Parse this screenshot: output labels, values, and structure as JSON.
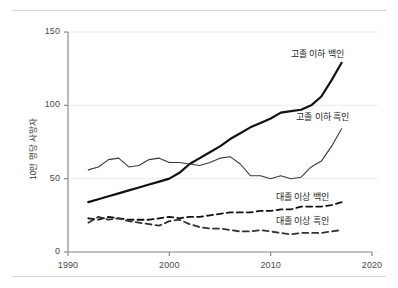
{
  "chart_data": {
    "type": "line",
    "title": "",
    "xlabel": "",
    "ylabel": "10만 명당 사망자",
    "xlim": [
      1990,
      2020
    ],
    "ylim": [
      0,
      150
    ],
    "xticks": [
      1990,
      2000,
      2010,
      2020
    ],
    "yticks": [
      0,
      50,
      100,
      150
    ],
    "grid": true,
    "grid_axis": "y",
    "legend_position": "inline-labels",
    "x": [
      1992,
      1993,
      1994,
      1995,
      1996,
      1997,
      1998,
      1999,
      2000,
      2001,
      2002,
      2003,
      2004,
      2005,
      2006,
      2007,
      2008,
      2009,
      2010,
      2011,
      2012,
      2013,
      2014,
      2015,
      2016,
      2017
    ],
    "series": [
      {
        "name": "고졸 이하 백인",
        "label": "고졸 이하 백인",
        "style": "solid",
        "width": 2.2,
        "color": "#111111",
        "label_x": 2012.0,
        "label_y": 136,
        "values": [
          34,
          36,
          38,
          40,
          42,
          44,
          46,
          48,
          50,
          54,
          60,
          64,
          68,
          72,
          77,
          81,
          85,
          88,
          91,
          95,
          96,
          97,
          100,
          106,
          117,
          129
        ]
      },
      {
        "name": "고졸 이하 흑인",
        "label": "고졸 이하 흑인",
        "style": "solid",
        "width": 1.1,
        "color": "#3a3a3a",
        "label_x": 2012.5,
        "label_y": 93,
        "values": [
          56,
          58,
          63,
          64,
          58,
          59,
          63,
          64,
          61,
          61,
          60,
          59,
          61,
          64,
          65,
          60,
          52,
          52,
          50,
          52,
          50,
          51,
          58,
          62,
          72,
          84
        ]
      },
      {
        "name": "대졸 이상 백인",
        "label": "대졸 이상 백인",
        "style": "dashed",
        "width": 1.8,
        "color": "#111111",
        "label_x": 2010.5,
        "label_y": 38,
        "values": [
          23,
          22,
          24,
          23,
          22,
          22,
          22,
          23,
          24,
          23,
          24,
          24,
          25,
          26,
          27,
          27,
          27,
          28,
          28,
          29,
          29,
          31,
          31,
          31,
          32,
          34
        ]
      },
      {
        "name": "대졸 이상 흑인",
        "label": "대졸 이상 흑인",
        "style": "dashed",
        "width": 1.8,
        "color": "#333333",
        "label_x": 2010.5,
        "label_y": 22,
        "values": [
          20,
          24,
          22,
          23,
          21,
          20,
          19,
          18,
          21,
          22,
          19,
          17,
          16,
          16,
          15,
          14,
          14,
          15,
          14,
          13,
          12,
          13,
          13,
          13,
          14,
          15
        ]
      }
    ]
  }
}
